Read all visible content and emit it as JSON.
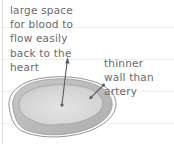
{
  "diagram": {
    "labels": {
      "lumen": {
        "lines": [
          "large space",
          "for blood to",
          "flow easily",
          "back to the",
          "heart"
        ]
      },
      "wall": {
        "lines": [
          "thinner",
          "wall than",
          "artery"
        ]
      }
    },
    "colors": {
      "text": "#6a6a6a",
      "arrow": "#5a5a5a",
      "outline": "#949494",
      "wall_fill": "#bdbdbd",
      "lumen_fill": "#d9d9d9",
      "ruled_line": "#edeff1",
      "margin_line": "#e2e2e5",
      "page_bg": "#ffffff"
    }
  }
}
